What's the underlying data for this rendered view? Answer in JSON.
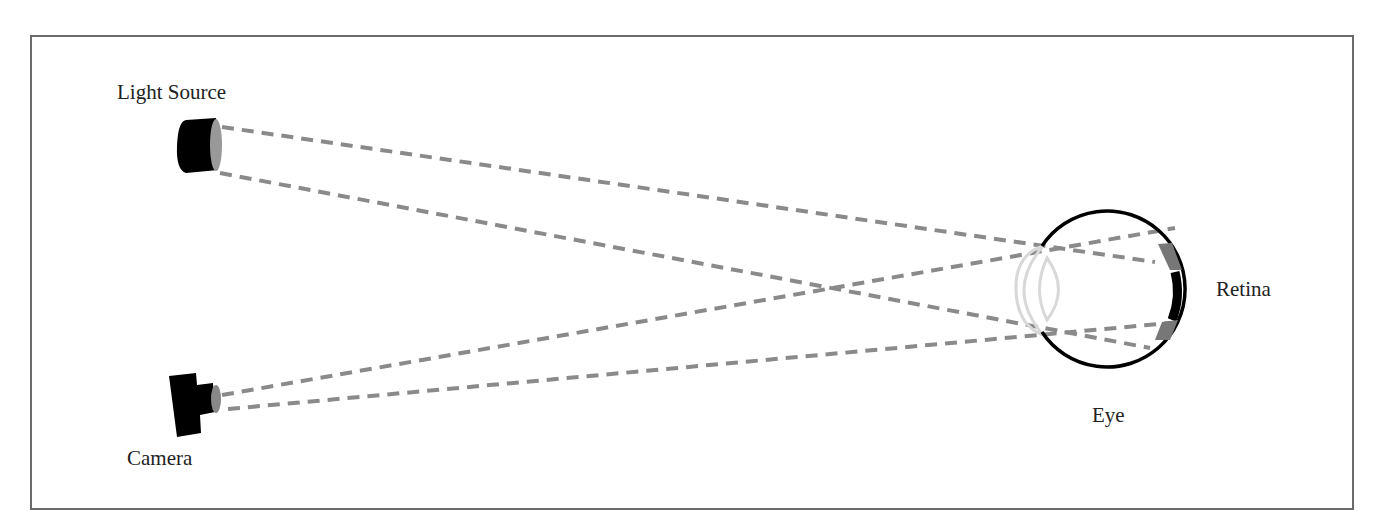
{
  "labels": {
    "light_source": "Light Source",
    "camera": "Camera",
    "retina": "Retina",
    "eye": "Eye"
  },
  "colors": {
    "frame": "#6a6a6a",
    "beam": "#8a8a8a",
    "device": "#000000",
    "lens": "#d8d8d8",
    "retina_highlight": "#777777"
  }
}
